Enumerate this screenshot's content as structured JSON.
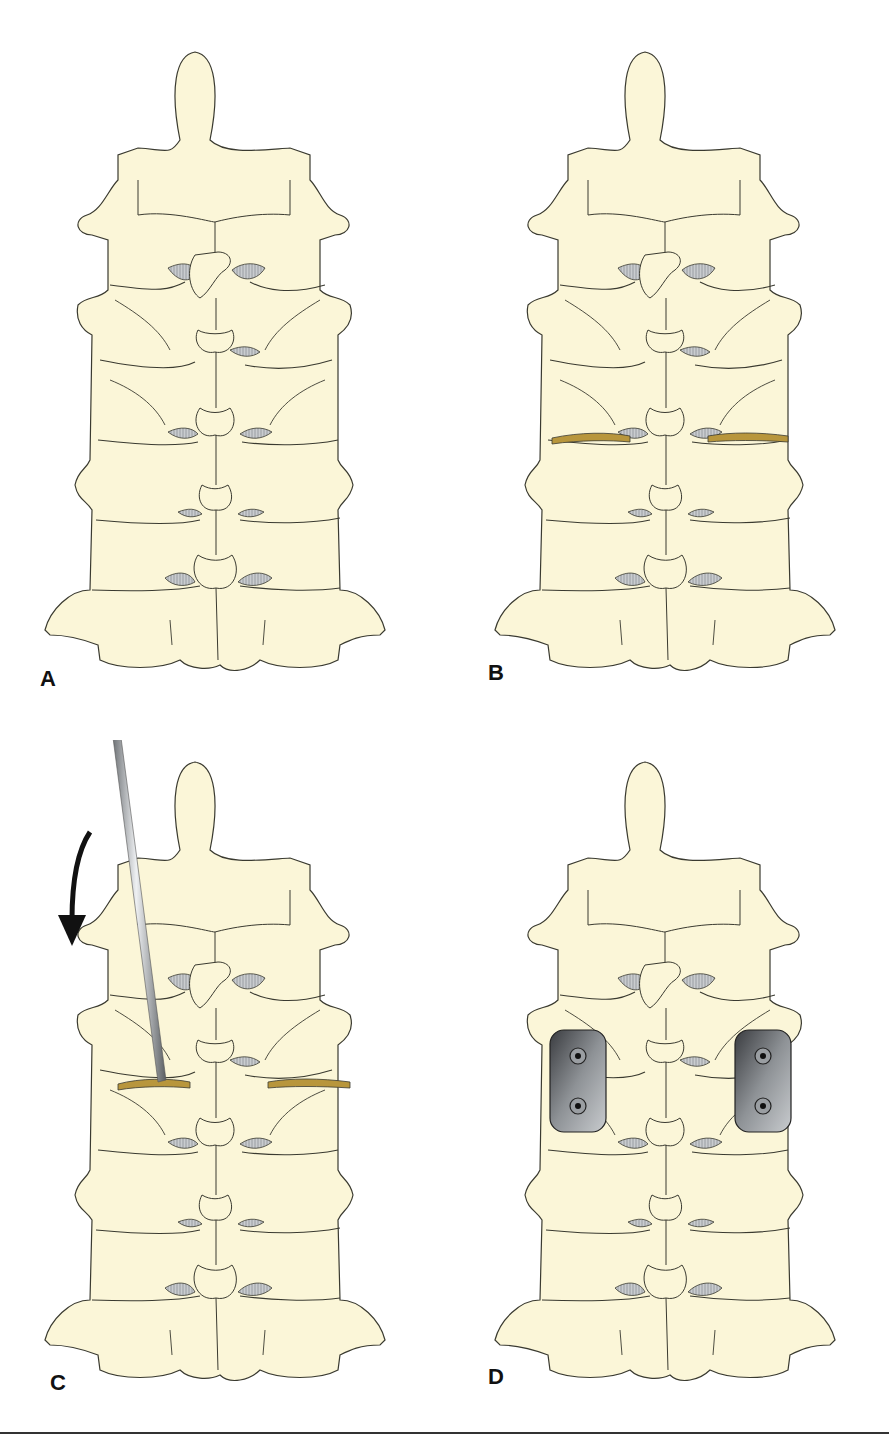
{
  "figure": {
    "panels": [
      {
        "id": "A",
        "label": "A",
        "description": "Posterior view of cervical spine, intact"
      },
      {
        "id": "B",
        "label": "B",
        "description": "Osteotomy cuts at lateral masses (tan cut lines)"
      },
      {
        "id": "C",
        "label": "C",
        "description": "Instrument rod used to open osteotomy with downward curved arrow"
      },
      {
        "id": "D",
        "label": "D",
        "description": "Two plates with two screws each fixed across the osteotomy"
      }
    ],
    "colors": {
      "bone": "#fbf6d8",
      "outline": "#3a3a30",
      "disc_gap": "#b8bcc0",
      "osteotomy_cut": "#b8963c",
      "plate": "#6f7276",
      "rod": "#9a9ea2",
      "arrow": "#111111"
    }
  }
}
